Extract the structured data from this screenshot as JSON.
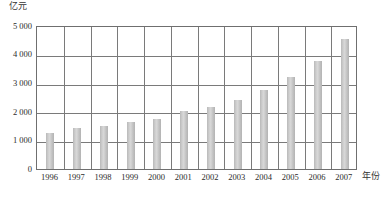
{
  "chart_data": {
    "type": "bar",
    "title": "",
    "subtitle": "",
    "xlabel": "年份",
    "ylabel": "亿元",
    "categories": [
      "1996",
      "1997",
      "1998",
      "1999",
      "2000",
      "2001",
      "2002",
      "2003",
      "2004",
      "2005",
      "2006",
      "2007"
    ],
    "values": [
      1250,
      1420,
      1500,
      1620,
      1740,
      2000,
      2150,
      2400,
      2760,
      3200,
      3760,
      4520
    ],
    "series": [
      {
        "name": "",
        "values": [
          1250,
          1420,
          1500,
          1620,
          1740,
          2000,
          2150,
          2400,
          2760,
          3200,
          3760,
          4520
        ]
      }
    ],
    "ylim": [
      0,
      5000
    ],
    "ytick_values": [
      0,
      1000,
      2000,
      3000,
      4000,
      5000
    ],
    "ytick_labels": [
      "0",
      "1 000",
      "2 000",
      "3 000",
      "4 000",
      "5 000"
    ],
    "grid": "horizontal-and-vertical",
    "legend": "none",
    "bar_color": "#cccccc",
    "axis_color": "#6f6f6f",
    "grid_color": "#7a7a7a"
  },
  "axes": {
    "y_unit_label": "亿元",
    "x_axis_name": "年份"
  },
  "caption": {
    "text": ""
  }
}
